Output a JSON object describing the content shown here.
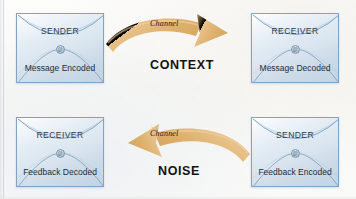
{
  "diagram": {
    "colors": {
      "arrow": "#e0b473",
      "arrow_shade": "#c99b57",
      "envelope_border": "#7fa3c4",
      "envelope_fill": "#dbe6f0",
      "label_text": "#131313",
      "background": "#fbfbf9"
    },
    "envelopes": [
      {
        "id": "top-left",
        "role": "SENDER",
        "action": "Message Encoded",
        "seal": "@"
      },
      {
        "id": "top-right",
        "role": "RECEIVER",
        "action": "Message Decoded",
        "seal": "@"
      },
      {
        "id": "bottom-left",
        "role": "RECEIVER",
        "action": "Feedback Decoded",
        "seal": "@"
      },
      {
        "id": "bottom-right",
        "role": "SENDER",
        "action": "Feedback Encoded",
        "seal": "@"
      }
    ],
    "arrows": [
      {
        "id": "arrow-top",
        "label": "Channel",
        "direction": "right",
        "from": "top-left",
        "to": "top-right"
      },
      {
        "id": "arrow-bottom",
        "label": "Channel",
        "direction": "left",
        "from": "bottom-right",
        "to": "bottom-left"
      }
    ],
    "center_labels": [
      {
        "id": "context",
        "text": "CONTEXT"
      },
      {
        "id": "noise",
        "text": "NOISE"
      }
    ]
  }
}
